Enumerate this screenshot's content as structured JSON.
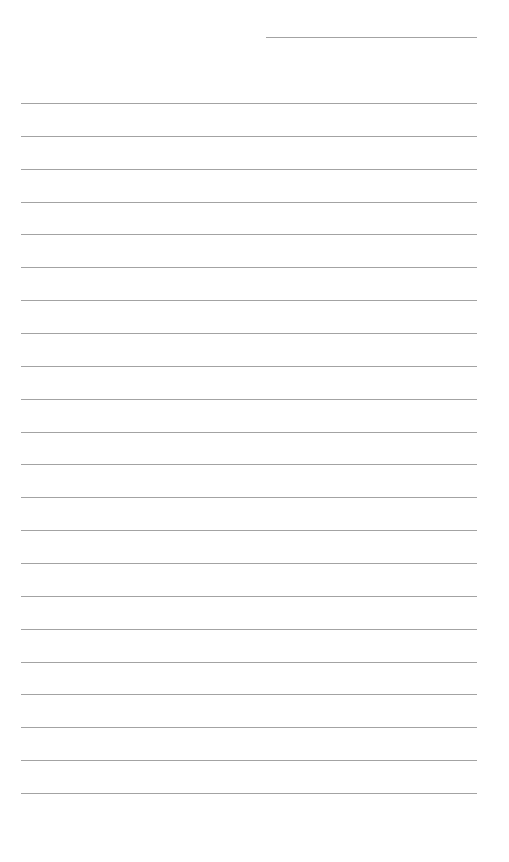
{
  "page": {
    "type": "lined-writing-paper",
    "background": "#ffffff",
    "line_color": "#a3a3a3",
    "header_line": {
      "x": 266,
      "y": 37,
      "width": 211,
      "label": ""
    },
    "lines": {
      "count": 22,
      "x": 21,
      "width": 456,
      "first_y": 103,
      "spacing": 32.86
    },
    "text_entries": []
  }
}
